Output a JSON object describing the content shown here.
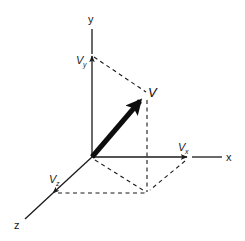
{
  "diagram": {
    "axes": {
      "x": {
        "label": "x"
      },
      "y": {
        "label": "y"
      },
      "z": {
        "label": "z"
      }
    },
    "vector": {
      "label": "V"
    },
    "components": {
      "x": {
        "main": "V",
        "sub": "x"
      },
      "y": {
        "main": "V",
        "sub": "y"
      },
      "z": {
        "main": "V",
        "sub": "z"
      }
    },
    "colors": {
      "ink": "#1a1a1a",
      "background": "#ffffff"
    }
  }
}
